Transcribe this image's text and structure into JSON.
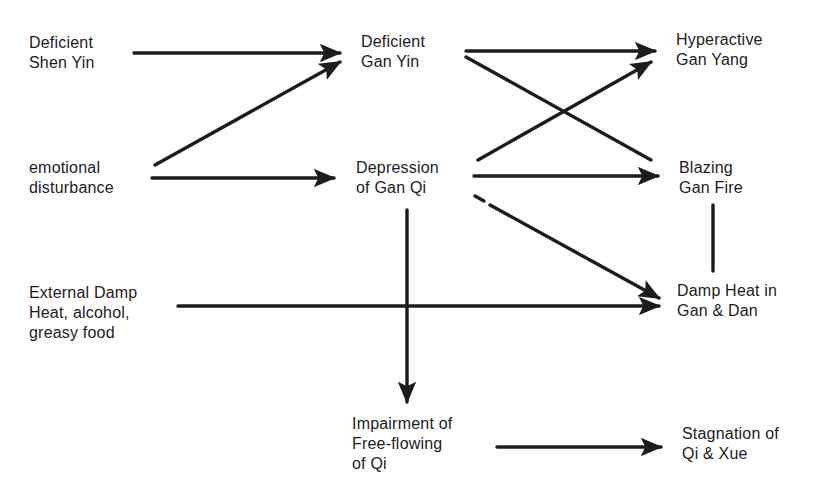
{
  "diagram": {
    "type": "flow",
    "nodes": {
      "deficient_shen_yin": {
        "lines": [
          "Deficient",
          "Shen Yin"
        ]
      },
      "deficient_gan_yin": {
        "lines": [
          "Deficient",
          "Gan Yin"
        ]
      },
      "hyperactive_gan_yang": {
        "lines": [
          "Hyperactive",
          "Gan Yang"
        ]
      },
      "emotional_disturbance": {
        "lines": [
          "emotional",
          "disturbance"
        ]
      },
      "depression_of_gan_qi": {
        "lines": [
          "Depression",
          "of Gan Qi"
        ]
      },
      "blazing_gan_fire": {
        "lines": [
          "Blazing",
          "Gan Fire"
        ]
      },
      "external_damp_heat": {
        "lines": [
          "External Damp",
          "Heat, alcohol,",
          "greasy food"
        ]
      },
      "damp_heat_gan_dan": {
        "lines": [
          "Damp Heat in",
          "Gan & Dan"
        ]
      },
      "impairment_free_flowing": {
        "lines": [
          "Impairment of",
          "Free-flowing",
          "of Qi"
        ]
      },
      "stagnation_qi_xue": {
        "lines": [
          "Stagnation of",
          "Qi & Xue"
        ]
      }
    },
    "edges": [
      {
        "from": "Deficient Shen Yin",
        "to": "Deficient Gan Yin",
        "arrow": true
      },
      {
        "from": "emotional disturbance",
        "to": "Deficient Gan Yin",
        "arrow": true
      },
      {
        "from": "emotional disturbance",
        "to": "Depression of Gan Qi",
        "arrow": true
      },
      {
        "from": "Deficient Gan Yin",
        "to": "Hyperactive Gan Yang",
        "arrow": true
      },
      {
        "from": "Deficient Gan Yin",
        "to": "Blazing Gan Fire",
        "arrow": false
      },
      {
        "from": "Depression of Gan Qi",
        "to": "Hyperactive Gan Yang",
        "arrow": true
      },
      {
        "from": "Depression of Gan Qi",
        "to": "Blazing Gan Fire",
        "arrow": true
      },
      {
        "from": "Depression of Gan Qi",
        "to": "Damp Heat in Gan & Dan",
        "arrow": true
      },
      {
        "from": "Depression of Gan Qi",
        "to": "Impairment of Free-flowing of Qi",
        "arrow": true
      },
      {
        "from": "External Damp Heat, alcohol, greasy food",
        "to": "Damp Heat in Gan & Dan",
        "arrow": true
      },
      {
        "from": "Blazing Gan Fire",
        "to": "Damp Heat in Gan & Dan",
        "arrow": false
      },
      {
        "from": "Impairment of Free-flowing of Qi",
        "to": "Stagnation of Qi & Xue",
        "arrow": true
      }
    ],
    "colors": {
      "ink": "#1c1c1c",
      "background": "#ffffff"
    }
  }
}
